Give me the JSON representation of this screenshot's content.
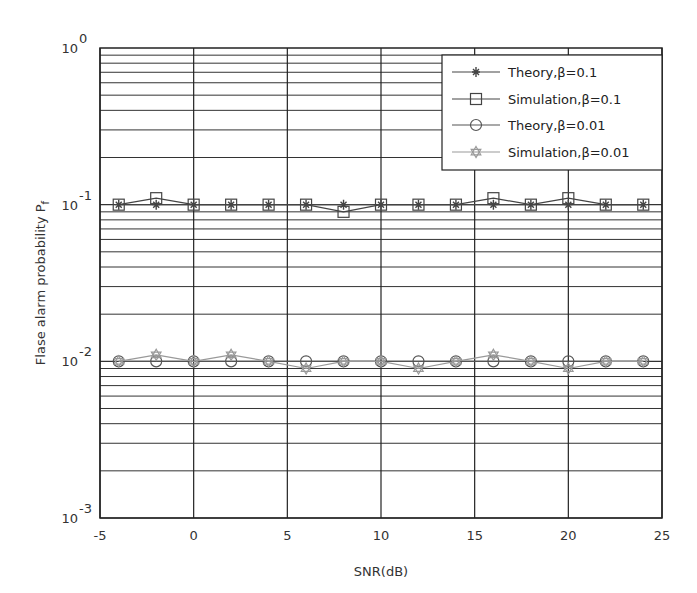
{
  "chart_data": {
    "type": "line",
    "title": "",
    "xlabel": "SNR(dB)",
    "ylabel": "Flase alarm probability P",
    "ylabel_subscript": "f",
    "xlim": [
      -5,
      25
    ],
    "ylim": [
      0.001,
      1
    ],
    "yscale": "log",
    "grid": true,
    "legend_position": "upper right",
    "x_ticks": [
      "-5",
      "0",
      "5",
      "10",
      "15",
      "20",
      "25"
    ],
    "y_ticks": [
      {
        "base": "10",
        "exp": "0"
      },
      {
        "base": "10",
        "exp": "-1"
      },
      {
        "base": "10",
        "exp": "-2"
      },
      {
        "base": "10",
        "exp": "-3"
      }
    ],
    "x": [
      -4,
      -2,
      0,
      2,
      4,
      6,
      8,
      10,
      12,
      14,
      16,
      18,
      20,
      22,
      24
    ],
    "series": [
      {
        "name": "Theory,β=0.1",
        "marker": "star",
        "color": "#444444",
        "values": [
          0.1,
          0.1,
          0.1,
          0.1,
          0.1,
          0.1,
          0.1,
          0.1,
          0.1,
          0.1,
          0.1,
          0.1,
          0.1,
          0.1,
          0.1
        ]
      },
      {
        "name": "Simulation,β=0.1",
        "marker": "square",
        "color": "#444444",
        "values": [
          0.1,
          0.11,
          0.1,
          0.1,
          0.1,
          0.1,
          0.09,
          0.1,
          0.1,
          0.1,
          0.11,
          0.1,
          0.11,
          0.1,
          0.1
        ]
      },
      {
        "name": "Theory,β=0.01",
        "marker": "circle",
        "color": "#555555",
        "values": [
          0.01,
          0.01,
          0.01,
          0.01,
          0.01,
          0.01,
          0.01,
          0.01,
          0.01,
          0.01,
          0.01,
          0.01,
          0.01,
          0.01,
          0.01
        ]
      },
      {
        "name": "Simulation,β=0.01",
        "marker": "hexagram",
        "color": "#999999",
        "values": [
          0.01,
          0.011,
          0.01,
          0.011,
          0.01,
          0.009,
          0.01,
          0.01,
          0.009,
          0.01,
          0.011,
          0.01,
          0.009,
          0.01,
          0.01
        ]
      }
    ]
  }
}
